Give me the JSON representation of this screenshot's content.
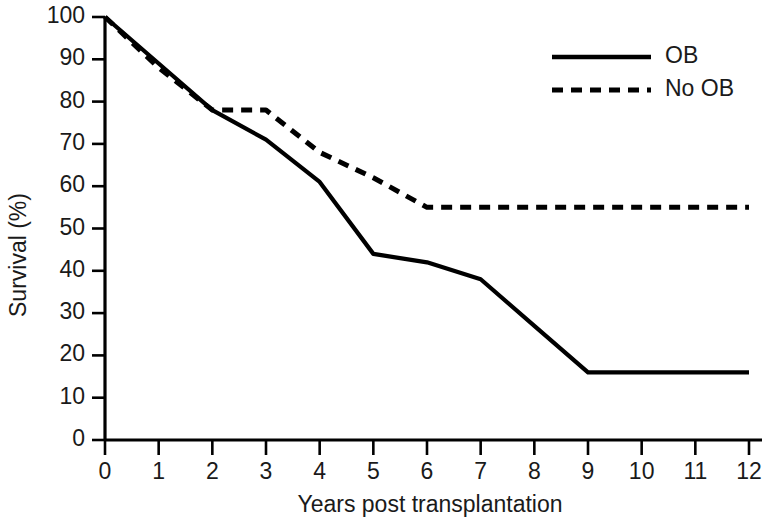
{
  "chart_data": {
    "type": "line",
    "title": "",
    "subtitle": "",
    "xlabel": "Years post transplantation",
    "ylabel": "Survival (%)",
    "xlim": [
      0,
      12
    ],
    "ylim": [
      0,
      100
    ],
    "xticks": [
      0,
      1,
      2,
      3,
      4,
      5,
      6,
      7,
      8,
      9,
      10,
      11,
      12
    ],
    "xtick_labels": [
      "0",
      "1",
      "2",
      "3",
      "4",
      "5",
      "6",
      "7",
      "8",
      "9",
      "10",
      "11",
      "12"
    ],
    "yticks": [
      0,
      10,
      20,
      30,
      40,
      50,
      60,
      70,
      80,
      90,
      100
    ],
    "ytick_labels": [
      "0",
      "10",
      "20",
      "30",
      "40",
      "50",
      "60",
      "70",
      "80",
      "90",
      "100"
    ],
    "grid": false,
    "legend_position": "top-right",
    "series": [
      {
        "name": "OB",
        "style": "solid",
        "color": "#000000",
        "x": [
          0,
          1,
          2,
          3,
          4,
          5,
          6,
          7,
          8,
          9,
          10,
          11,
          12
        ],
        "values": [
          100,
          89,
          78,
          71,
          61,
          44,
          42,
          38,
          27,
          16,
          16,
          16,
          16
        ]
      },
      {
        "name": "No OB",
        "style": "dashed",
        "color": "#000000",
        "x": [
          0,
          1,
          2,
          3,
          4,
          5,
          6,
          7,
          8,
          9,
          10,
          11,
          12
        ],
        "values": [
          100,
          88,
          78,
          78,
          68,
          62,
          55,
          55,
          55,
          55,
          55,
          55,
          55
        ]
      }
    ]
  },
  "legend": {
    "entries": [
      {
        "label": "OB",
        "style": "solid"
      },
      {
        "label": "No OB",
        "style": "dashed"
      }
    ]
  },
  "axes": {
    "x_title": "Years post transplantation",
    "y_title": "Survival (%)"
  }
}
